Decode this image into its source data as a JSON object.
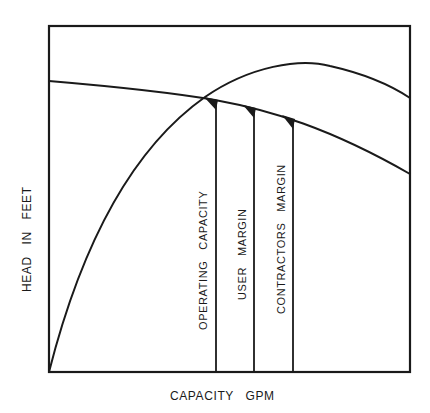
{
  "diagram": {
    "x_axis_label": "CAPACITY   GPM",
    "y_axis_label": "HEAD   IN   FEET",
    "curves": [
      {
        "name": "pump-head-curve",
        "description": "falling head-capacity curve"
      },
      {
        "name": "system-curve",
        "description": "rising system/efficiency curve"
      }
    ],
    "markers": [
      {
        "label": "OPERATING   CAPACITY"
      },
      {
        "label": "USER   MARGIN"
      },
      {
        "label": "CONTRACTORS   MARGIN"
      }
    ],
    "colors": {
      "line": "#1a1a1a",
      "background": "#ffffff"
    }
  }
}
